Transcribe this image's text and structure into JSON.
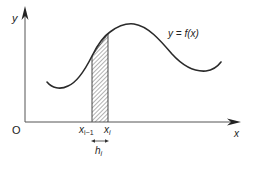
{
  "diagram": {
    "type": "function-graph-strip",
    "axes": {
      "origin_label": "O",
      "x_label": "x",
      "y_label": "y"
    },
    "curve": {
      "label": "y = f(x)",
      "color": "#2a2a2a"
    },
    "strip": {
      "left_label_base": "x",
      "left_label_sub": "i−1",
      "right_label_base": "x",
      "right_label_sub": "i",
      "width_label_base": "h",
      "width_label_sub": "i",
      "hatch_color": "#555555"
    }
  }
}
